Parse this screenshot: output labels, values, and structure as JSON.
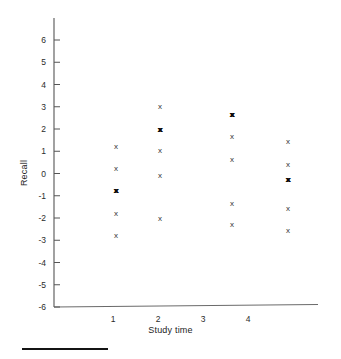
{
  "chart_data": {
    "type": "scatter",
    "title": "",
    "xlabel": "Study time",
    "ylabel": "Recall",
    "xlim": [
      0.5,
      4.6
    ],
    "ylim": [
      -6,
      6.6
    ],
    "xticks": [
      1,
      2,
      3,
      4
    ],
    "xtick_labels": [
      "1",
      "2",
      "3",
      "4"
    ],
    "yticks": [
      -6,
      -5,
      -4,
      -3,
      -2,
      -1,
      0,
      1,
      2,
      3,
      4,
      5,
      6
    ],
    "ytick_labels": [
      "-6",
      "-5",
      "-4",
      "-3",
      "-2",
      "-1",
      "0",
      "1",
      "2",
      "3",
      "4",
      "5",
      "6"
    ],
    "grid": false,
    "legend": null,
    "marker": "x",
    "marker_color": "#333333",
    "axis_color": "#555555",
    "points": [
      {
        "x": 1,
        "y": 1.2,
        "count": 1
      },
      {
        "x": 1,
        "y": 0.2,
        "count": 1
      },
      {
        "x": 1,
        "y": -0.8,
        "count": 2
      },
      {
        "x": 1,
        "y": -1.8,
        "count": 1
      },
      {
        "x": 1,
        "y": -2.8,
        "count": 1
      },
      {
        "x": 2,
        "y": 3.0,
        "count": 1
      },
      {
        "x": 2,
        "y": 1.95,
        "count": 2
      },
      {
        "x": 2,
        "y": 1.0,
        "count": 1
      },
      {
        "x": 2,
        "y": -0.1,
        "count": 1
      },
      {
        "x": 2,
        "y": -2.05,
        "count": 1
      },
      {
        "x": 3,
        "y": 2.65,
        "count": 2
      },
      {
        "x": 3,
        "y": 1.65,
        "count": 1
      },
      {
        "x": 3,
        "y": 0.6,
        "count": 1
      },
      {
        "x": 3,
        "y": -1.35,
        "count": 1
      },
      {
        "x": 3,
        "y": -2.3,
        "count": 1
      },
      {
        "x": 4,
        "y": 1.4,
        "count": 1
      },
      {
        "x": 4,
        "y": 0.4,
        "count": 1
      },
      {
        "x": 4,
        "y": -0.3,
        "count": 2
      },
      {
        "x": 4,
        "y": -1.6,
        "count": 1
      },
      {
        "x": 4,
        "y": -2.6,
        "count": 1
      }
    ]
  },
  "figure": {
    "marker_glyph": "x"
  }
}
